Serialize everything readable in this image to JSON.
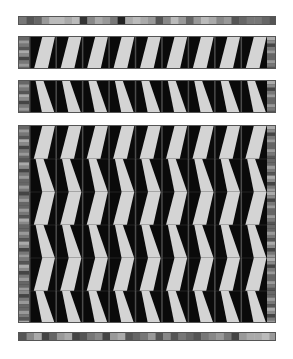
{
  "colors": {
    "dark": "#0a0a0a",
    "light": "#d4d4d4",
    "edge": "#555555"
  },
  "layout": {
    "left": 18,
    "width": 258,
    "strip_width": 10,
    "columns": 9
  },
  "bars": [
    {
      "name": "top-color-bar",
      "y": 16,
      "h": 9,
      "swatches": [
        "#777",
        "#555",
        "#666",
        "#999",
        "#bbb",
        "#bbb",
        "#aaa",
        "#bbb",
        "#333",
        "#888",
        "#aaa",
        "#999",
        "#777",
        "#222",
        "#aaa",
        "#bbb",
        "#aaa",
        "#999",
        "#555",
        "#888",
        "#bbb",
        "#999",
        "#666",
        "#999",
        "#bbb",
        "#aaa",
        "#888",
        "#999",
        "#555",
        "#666",
        "#777",
        "#777",
        "#666",
        "#555"
      ]
    },
    {
      "name": "bottom-color-bar",
      "y": 332,
      "h": 9,
      "swatches": [
        "#555",
        "#888",
        "#aaa",
        "#444",
        "#666",
        "#999",
        "#aaa",
        "#444",
        "#555",
        "#777",
        "#888",
        "#444",
        "#999",
        "#aaa",
        "#555",
        "#666",
        "#777",
        "#999",
        "#555",
        "#888",
        "#555",
        "#777",
        "#666",
        "#555",
        "#777",
        "#888",
        "#999",
        "#777",
        "#444",
        "#999",
        "#aaa",
        "#aaa",
        "#bbb",
        "#999"
      ]
    }
  ],
  "tile_bands": [
    {
      "name": "band-1",
      "y": 36,
      "rows": [
        0
      ]
    },
    {
      "name": "band-2",
      "y": 80,
      "rows": [
        1
      ]
    },
    {
      "name": "band-3",
      "y": 125,
      "rows": [
        0,
        1,
        0,
        1,
        0,
        1
      ]
    }
  ],
  "row_height": 33,
  "strip_colors": [
    "#666",
    "#999",
    "#777",
    "#555",
    "#aaa",
    "#888",
    "#444",
    "#777",
    "#999",
    "#666"
  ]
}
